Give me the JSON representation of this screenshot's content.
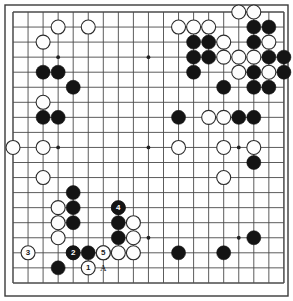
{
  "diagram": {
    "kind": "go-board-diagram",
    "board_size": 19,
    "colors": {
      "background": "#ffffff",
      "line": "#4a4a4a",
      "border": "#3a3a3a",
      "black_stone": "#141414",
      "white_stone": "#fdfdfd",
      "white_stone_edge": "#2b2b2b",
      "star_point": "#222222",
      "label_on_black": "#ffffff",
      "label_on_white": "#1a1a1a"
    },
    "geometry": {
      "origin_x": 13,
      "origin_y": 12,
      "spacing": 15.05,
      "stone_radius": 7.0,
      "star_radius": 1.9,
      "border_inset": 5
    },
    "star_points": [
      [
        3,
        3
      ],
      [
        9,
        3
      ],
      [
        15,
        3
      ],
      [
        3,
        9
      ],
      [
        9,
        9
      ],
      [
        15,
        9
      ],
      [
        3,
        15
      ],
      [
        9,
        15
      ],
      [
        15,
        15
      ]
    ],
    "black_stones": [
      [
        2,
        4
      ],
      [
        3,
        4
      ],
      [
        4,
        5
      ],
      [
        2,
        7
      ],
      [
        3,
        7
      ],
      [
        12,
        2
      ],
      [
        13,
        2
      ],
      [
        16,
        1
      ],
      [
        17,
        1
      ],
      [
        16,
        2
      ],
      [
        12,
        3
      ],
      [
        13,
        3
      ],
      [
        17,
        3
      ],
      [
        18,
        3
      ],
      [
        16,
        4
      ],
      [
        12,
        4
      ],
      [
        18,
        4
      ],
      [
        14,
        5
      ],
      [
        16,
        5
      ],
      [
        17,
        5
      ],
      [
        11,
        7
      ],
      [
        15,
        7
      ],
      [
        16,
        7
      ],
      [
        16,
        10
      ],
      [
        4,
        12
      ],
      [
        4,
        13
      ],
      [
        4,
        14
      ],
      [
        7,
        13
      ],
      [
        7,
        14
      ],
      [
        7,
        15
      ],
      [
        4,
        16
      ],
      [
        5,
        16
      ],
      [
        3,
        17
      ],
      [
        11,
        16
      ],
      [
        14,
        16
      ],
      [
        16,
        15
      ]
    ],
    "white_stones": [
      [
        3,
        1
      ],
      [
        5,
        1
      ],
      [
        2,
        2
      ],
      [
        2,
        6
      ],
      [
        11,
        1
      ],
      [
        12,
        1
      ],
      [
        13,
        1
      ],
      [
        15,
        0
      ],
      [
        14,
        2
      ],
      [
        16,
        0
      ],
      [
        17,
        2
      ],
      [
        14,
        3
      ],
      [
        15,
        3
      ],
      [
        16,
        3
      ],
      [
        17,
        4
      ],
      [
        15,
        4
      ],
      [
        13,
        7
      ],
      [
        14,
        7
      ],
      [
        0,
        9
      ],
      [
        2,
        9
      ],
      [
        11,
        9
      ],
      [
        14,
        9
      ],
      [
        16,
        9
      ],
      [
        2,
        11
      ],
      [
        14,
        11
      ],
      [
        3,
        13
      ],
      [
        3,
        14
      ],
      [
        3,
        15
      ],
      [
        8,
        14
      ],
      [
        8,
        15
      ],
      [
        6,
        16
      ],
      [
        8,
        16
      ],
      [
        7,
        16
      ]
    ],
    "numbered_moves": [
      {
        "number": "1",
        "color": "white",
        "col": 5,
        "row": 17
      },
      {
        "number": "2",
        "color": "black",
        "col": 4,
        "row": 16
      },
      {
        "number": "3",
        "color": "white",
        "col": 1,
        "row": 16
      },
      {
        "number": "4",
        "color": "black",
        "col": 7,
        "row": 13
      },
      {
        "number": "5",
        "color": "white",
        "col": 6,
        "row": 16
      }
    ],
    "point_markers": [
      {
        "text": "A",
        "col": 6,
        "row": 17
      }
    ]
  }
}
